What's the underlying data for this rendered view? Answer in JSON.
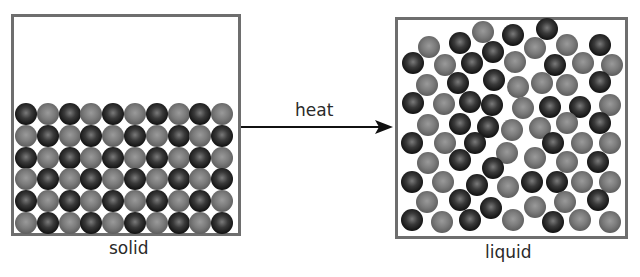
{
  "labels": {
    "solid": "solid",
    "liquid": "liquid",
    "arrow": "heat"
  },
  "colors": {
    "border": "#6e6e6e",
    "dark_particle": "#1a1a1a",
    "gray_particle": "#6f6f6f",
    "text": "#2a2a2a"
  },
  "solid": {
    "columns": 10,
    "rows": 6,
    "pattern": "alternating dark/gray checkerboard, top-left dark"
  },
  "liquid": {
    "particles": [
      [
        483,
        32,
        "g"
      ],
      [
        513,
        35,
        "d"
      ],
      [
        547,
        29,
        "d"
      ],
      [
        429,
        47,
        "g"
      ],
      [
        460,
        43,
        "d"
      ],
      [
        493,
        52,
        "d"
      ],
      [
        535,
        48,
        "g"
      ],
      [
        567,
        45,
        "g"
      ],
      [
        600,
        45,
        "d"
      ],
      [
        413,
        63,
        "d"
      ],
      [
        445,
        65,
        "g"
      ],
      [
        472,
        63,
        "d"
      ],
      [
        515,
        62,
        "g"
      ],
      [
        555,
        65,
        "d"
      ],
      [
        583,
        63,
        "g"
      ],
      [
        612,
        65,
        "g"
      ],
      [
        427,
        85,
        "g"
      ],
      [
        458,
        83,
        "d"
      ],
      [
        494,
        80,
        "d"
      ],
      [
        518,
        87,
        "g"
      ],
      [
        542,
        83,
        "g"
      ],
      [
        567,
        85,
        "g"
      ],
      [
        600,
        82,
        "d"
      ],
      [
        413,
        103,
        "d"
      ],
      [
        444,
        104,
        "g"
      ],
      [
        470,
        102,
        "d"
      ],
      [
        492,
        105,
        "d"
      ],
      [
        523,
        108,
        "g"
      ],
      [
        550,
        107,
        "d"
      ],
      [
        580,
        107,
        "d"
      ],
      [
        610,
        105,
        "g"
      ],
      [
        428,
        125,
        "g"
      ],
      [
        460,
        124,
        "d"
      ],
      [
        488,
        127,
        "d"
      ],
      [
        512,
        130,
        "g"
      ],
      [
        540,
        128,
        "g"
      ],
      [
        567,
        123,
        "g"
      ],
      [
        600,
        123,
        "d"
      ],
      [
        412,
        143,
        "d"
      ],
      [
        445,
        143,
        "g"
      ],
      [
        475,
        143,
        "d"
      ],
      [
        507,
        153,
        "g"
      ],
      [
        553,
        143,
        "d"
      ],
      [
        582,
        143,
        "g"
      ],
      [
        610,
        143,
        "g"
      ],
      [
        428,
        163,
        "g"
      ],
      [
        460,
        160,
        "d"
      ],
      [
        493,
        168,
        "d"
      ],
      [
        535,
        158,
        "g"
      ],
      [
        567,
        162,
        "g"
      ],
      [
        598,
        162,
        "d"
      ],
      [
        412,
        182,
        "d"
      ],
      [
        443,
        182,
        "g"
      ],
      [
        477,
        185,
        "d"
      ],
      [
        508,
        187,
        "g"
      ],
      [
        532,
        182,
        "d"
      ],
      [
        557,
        182,
        "d"
      ],
      [
        582,
        182,
        "g"
      ],
      [
        610,
        182,
        "g"
      ],
      [
        427,
        202,
        "g"
      ],
      [
        460,
        200,
        "d"
      ],
      [
        491,
        208,
        "d"
      ],
      [
        535,
        207,
        "g"
      ],
      [
        565,
        202,
        "g"
      ],
      [
        598,
        200,
        "d"
      ],
      [
        412,
        220,
        "d"
      ],
      [
        442,
        222,
        "g"
      ],
      [
        470,
        220,
        "d"
      ],
      [
        513,
        220,
        "g"
      ],
      [
        553,
        222,
        "d"
      ],
      [
        580,
        220,
        "g"
      ],
      [
        610,
        222,
        "g"
      ]
    ]
  }
}
